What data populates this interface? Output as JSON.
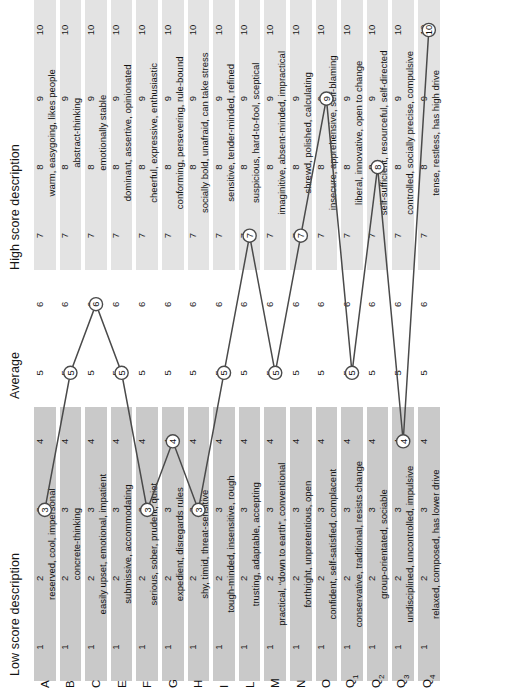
{
  "headers": {
    "low": "Low score description",
    "average": "Average",
    "high": "High score description"
  },
  "scale": {
    "ticks": [
      1,
      2,
      3,
      4,
      5,
      6,
      7,
      8,
      9,
      10
    ],
    "low_band": [
      1,
      4
    ],
    "average_band": [
      5,
      6
    ],
    "high_band": [
      7,
      10
    ]
  },
  "colors": {
    "low_band": "#c9c9c9",
    "average_band": "#ffffff",
    "high_band": "#e3e3e3",
    "line": "#4a4a4a",
    "marker_fill": "#ffffff"
  },
  "chart_data": {
    "type": "line",
    "title": "",
    "xlabel": "",
    "ylabel": "",
    "xlim": [
      1,
      10
    ],
    "categories": [
      "A",
      "B",
      "C",
      "E",
      "F",
      "G",
      "H",
      "I",
      "L",
      "M",
      "N",
      "O",
      "Q1",
      "Q2",
      "Q3",
      "Q4"
    ],
    "values": [
      3,
      5,
      6,
      5,
      3,
      4,
      3,
      5,
      7,
      5,
      7,
      9,
      5,
      8,
      4,
      10
    ],
    "series": [
      {
        "name": "Sten score profile",
        "values": [
          3,
          5,
          6,
          5,
          3,
          4,
          3,
          5,
          7,
          5,
          7,
          9,
          5,
          8,
          4,
          10
        ]
      }
    ]
  },
  "rows": [
    {
      "factor": "A",
      "sub": "",
      "low": "reserved, cool, impersonal",
      "high": "warm, easygoing, likes people",
      "score": 3
    },
    {
      "factor": "B",
      "sub": "",
      "low": "concrete-thinking",
      "high": "abstract-thinking",
      "score": 5
    },
    {
      "factor": "C",
      "sub": "",
      "low": "easily upset, emotional, impatient",
      "high": "emotionally stable",
      "score": 6
    },
    {
      "factor": "E",
      "sub": "",
      "low": "submissive, accommodating",
      "high": "dominant, assertive, opinionated",
      "score": 5
    },
    {
      "factor": "F",
      "sub": "",
      "low": "serious, sober, prudent, quiet",
      "high": "cheerful, expressive, enthusiastic",
      "score": 3
    },
    {
      "factor": "G",
      "sub": "",
      "low": "expedient, disregards rules",
      "high": "conforming, persevering, rule-bound",
      "score": 4
    },
    {
      "factor": "H",
      "sub": "",
      "low": "shy, timid, threat-sensitive",
      "high": "socially bold, unafraid, can take stress",
      "score": 3
    },
    {
      "factor": "I",
      "sub": "",
      "low": "tough-minded, insensitive, rough",
      "high": "sensitive, tender-minded, refined",
      "score": 5
    },
    {
      "factor": "L",
      "sub": "",
      "low": "trusting, adaptable, accepting",
      "high": "suspicious, hard-to-fool, sceptical",
      "score": 7
    },
    {
      "factor": "M",
      "sub": "",
      "low": "practical, “down to earth”, conventional",
      "high": "imaginitive, absent-minded, impractical",
      "score": 5
    },
    {
      "factor": "N",
      "sub": "",
      "low": "forthright, unpretentious, open",
      "high": "shrewd, polished, calculating",
      "score": 7
    },
    {
      "factor": "O",
      "sub": "",
      "low": "confident, self-satisfied, complacent",
      "high": "insecure, apprehensive, self-blaming",
      "score": 9
    },
    {
      "factor": "Q",
      "sub": "1",
      "low": "conservative, traditional, resists change",
      "high": "liberal, innovative, open to change",
      "score": 5
    },
    {
      "factor": "Q",
      "sub": "2",
      "low": "group-orientated, sociable",
      "high": "self-sufficient, resourceful, self-directed",
      "score": 8
    },
    {
      "factor": "Q",
      "sub": "3",
      "low": "undisciplined, uncontrolled, impulsive",
      "high": "controlled, socially precise, compulsive",
      "score": 4
    },
    {
      "factor": "Q",
      "sub": "4",
      "low": "relaxed, composed, has lower drive",
      "high": "tense, restless, has high drive",
      "score": 10
    }
  ]
}
